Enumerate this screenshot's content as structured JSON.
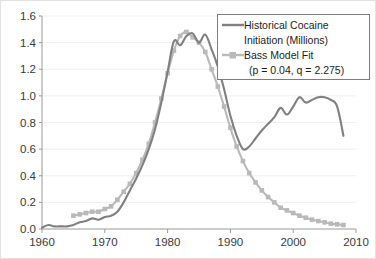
{
  "chart_data": {
    "type": "line",
    "title": "",
    "xlabel": "",
    "ylabel": "",
    "xlim": [
      1960,
      2010
    ],
    "ylim": [
      0.0,
      1.6
    ],
    "grid": true,
    "legend_position": "top-right",
    "x_ticks": [
      "1960",
      "1970",
      "1980",
      "1990",
      "2000",
      "2010"
    ],
    "x_tick_values": [
      1960,
      1970,
      1980,
      1990,
      2000,
      2010
    ],
    "y_ticks": [
      "0.0",
      "0.2",
      "0.4",
      "0.6",
      "0.8",
      "1.0",
      "1.2",
      "1.4",
      "1.6"
    ],
    "y_tick_values": [
      0.0,
      0.2,
      0.4,
      0.6,
      0.8,
      1.0,
      1.2,
      1.4,
      1.6
    ],
    "series": [
      {
        "name": "Historical Cocaine Initiation (Millions)",
        "legend_line1": "Historical Cocaine",
        "legend_line2": "Initiation (Millions)",
        "color": "#808080",
        "marker": "none",
        "x": [
          1960,
          1961,
          1962,
          1963,
          1964,
          1965,
          1966,
          1967,
          1968,
          1969,
          1970,
          1971,
          1972,
          1973,
          1974,
          1975,
          1976,
          1977,
          1978,
          1979,
          1980,
          1981,
          1982,
          1983,
          1984,
          1985,
          1986,
          1987,
          1988,
          1989,
          1990,
          1991,
          1992,
          1993,
          1994,
          1995,
          1996,
          1997,
          1998,
          1999,
          2000,
          2001,
          2002,
          2003,
          2004,
          2005,
          2006,
          2007,
          2008
        ],
        "y": [
          0.01,
          0.03,
          0.02,
          0.02,
          0.02,
          0.03,
          0.05,
          0.06,
          0.08,
          0.07,
          0.09,
          0.1,
          0.13,
          0.2,
          0.29,
          0.38,
          0.48,
          0.6,
          0.75,
          0.95,
          1.18,
          1.41,
          1.38,
          1.45,
          1.47,
          1.4,
          1.46,
          1.35,
          1.22,
          1.05,
          0.85,
          0.7,
          0.6,
          0.62,
          0.68,
          0.74,
          0.79,
          0.84,
          0.91,
          0.86,
          0.92,
          0.99,
          0.95,
          0.97,
          0.99,
          0.99,
          0.97,
          0.92,
          0.7
        ]
      },
      {
        "name": "Bass Model Fit (p = 0.04, q = 2.275)",
        "legend_line1": "Bass Model Fit",
        "legend_line2": "(p = 0.04, q = 2.275)",
        "color": "#b9b9b9",
        "marker": "square",
        "parameters": {
          "p": "0.04",
          "q": "2.275"
        },
        "x": [
          1965,
          1966,
          1967,
          1968,
          1969,
          1970,
          1971,
          1972,
          1973,
          1974,
          1975,
          1976,
          1977,
          1978,
          1979,
          1980,
          1981,
          1982,
          1983,
          1984,
          1985,
          1986,
          1987,
          1988,
          1989,
          1990,
          1991,
          1992,
          1993,
          1994,
          1995,
          1996,
          1997,
          1998,
          1999,
          2000,
          2001,
          2002,
          2003,
          2004,
          2005,
          2006,
          2007,
          2008
        ],
        "y": [
          0.1,
          0.11,
          0.12,
          0.13,
          0.13,
          0.15,
          0.17,
          0.22,
          0.28,
          0.34,
          0.42,
          0.52,
          0.64,
          0.8,
          0.98,
          1.17,
          1.34,
          1.45,
          1.48,
          1.44,
          1.4,
          1.33,
          1.2,
          1.07,
          0.92,
          0.76,
          0.62,
          0.51,
          0.42,
          0.35,
          0.29,
          0.24,
          0.2,
          0.16,
          0.14,
          0.12,
          0.1,
          0.085,
          0.07,
          0.06,
          0.05,
          0.04,
          0.035,
          0.03
        ]
      }
    ]
  }
}
